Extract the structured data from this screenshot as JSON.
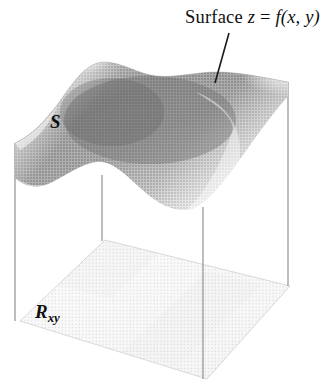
{
  "figure": {
    "kind": "3d-surface-over-region-diagram",
    "width": 336,
    "height": 392,
    "background": "#ffffff"
  },
  "labels": {
    "surface_caption": {
      "prefix": "Surface ",
      "z": "z",
      "equals": " = ",
      "f": "f",
      "args": "(x, y)",
      "full_text": "Surface z = f(x, y)",
      "x": 185,
      "y": 8,
      "font_size": 18.5
    },
    "surface_name": {
      "text": "S",
      "x": 50,
      "y": 112,
      "font_size": 19
    },
    "region_name": {
      "base": "R",
      "subscript": "xy",
      "full_text": "Rxy",
      "x": 35,
      "y": 302,
      "font_size": 19
    }
  },
  "leader_line": {
    "from_x": 229,
    "from_y": 33,
    "to_x": 215,
    "to_y": 83,
    "color": "#1a1a1a",
    "width": 1.6
  },
  "vertical_edges": [
    {
      "name": "left-back-edge",
      "x": 15,
      "y_top": 143,
      "y_bottom": 321,
      "color": "#9a9a9a"
    },
    {
      "name": "left-front-edge",
      "x": 102,
      "y_top": 175,
      "y_bottom": 241,
      "color": "#9a9a9a"
    },
    {
      "name": "mid-front-edge",
      "x": 203,
      "y_top": 207,
      "y_bottom": 379,
      "color": "#9a9a9a"
    },
    {
      "name": "right-back-edge",
      "x": 288,
      "y_top": 82,
      "y_bottom": 286,
      "color": "#9a9a9a"
    }
  ],
  "floor_region": {
    "name": "Rxy",
    "fill_light": "#f2f2f2",
    "fill_mid": "#e6e6e6",
    "fill_dark": "#dcdcdc",
    "corners": {
      "left": [
        20,
        321
      ],
      "top": [
        105,
        240
      ],
      "right": [
        290,
        286
      ],
      "bottom": [
        207,
        379
      ]
    }
  },
  "surface": {
    "name": "S",
    "shading_dark": "#707070",
    "shading_mid": "#9a9a9a",
    "shading_light": "#d8d8d8",
    "shading_highlight": "#f0f0f0",
    "texture": "halftone-dot-mesh",
    "description": "saddle-shaped surface with a ridge at upper-left and a valley sweeping to lower-right"
  },
  "colors": {
    "ink": "#101010",
    "edge_gray": "#9a9a9a",
    "page_white": "#ffffff"
  }
}
